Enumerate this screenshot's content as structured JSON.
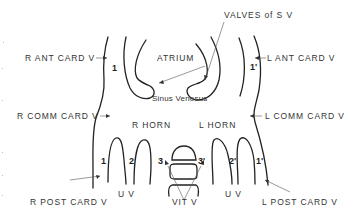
{
  "diagram": {
    "title": "",
    "labels": {
      "valves_sv": "VALVES of S V",
      "atrium": "ATRIUM",
      "sinus_venosus": "Sinus Venosus",
      "r_ant_card_v": "R ANT CARD V",
      "l_ant_card_v": "L ANT CARD V",
      "r_comm_card_v": "R COMM CARD V",
      "l_comm_card_v": "L COMM CARD V",
      "r_horn": "R HORN",
      "l_horn": "L HORN",
      "uv_left": "U V",
      "uv_right": "U V",
      "vit_v": "VIT V",
      "r_post_card_v": "R POST CARD V",
      "l_post_card_v": "L POST CARD V"
    },
    "numbers": {
      "r1_top": "1",
      "l1_top": "1'",
      "r1_bottom": "1",
      "r2": "2",
      "r3": "3",
      "l3": "3'",
      "l2": "2'",
      "l1_bottom": "1'"
    },
    "colors": {
      "line": "#222222",
      "leader": "#555555",
      "text": "#333333"
    }
  }
}
